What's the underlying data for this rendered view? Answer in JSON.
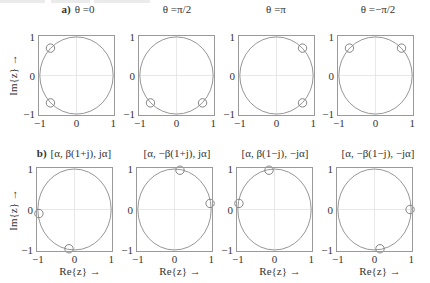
{
  "figure": {
    "row_a": {
      "prefix": "a)",
      "ylabel": "Im{z}  →"
    },
    "row_b": {
      "prefix": "b)",
      "ylabel": "Im{z}  →",
      "xlabel": "Re{z}  →"
    }
  },
  "chart_data": [
    {
      "type": "scatter",
      "row": "a",
      "title": "θ =0",
      "xlim": [
        -1,
        1
      ],
      "ylim": [
        -1,
        1
      ],
      "xticks": [
        "−1",
        "0",
        "1"
      ],
      "yticks": [
        "1",
        "0",
        "−1"
      ],
      "unit_circle": true,
      "points": [
        [
          -0.71,
          0.71
        ],
        [
          -0.71,
          -0.71
        ]
      ]
    },
    {
      "type": "scatter",
      "row": "a",
      "title": "θ =π/2",
      "xlim": [
        -1,
        1
      ],
      "ylim": [
        -1,
        1
      ],
      "xticks": [
        "−1",
        "0",
        "1"
      ],
      "yticks": [
        "1",
        "0",
        "−1"
      ],
      "unit_circle": true,
      "points": [
        [
          -0.71,
          -0.71
        ],
        [
          0.71,
          -0.71
        ]
      ]
    },
    {
      "type": "scatter",
      "row": "a",
      "title": "θ =π",
      "xlim": [
        -1,
        1
      ],
      "ylim": [
        -1,
        1
      ],
      "xticks": [
        "−1",
        "0",
        "1"
      ],
      "yticks": [
        "1",
        "0",
        "−1"
      ],
      "unit_circle": true,
      "points": [
        [
          0.71,
          0.71
        ],
        [
          0.71,
          -0.71
        ]
      ]
    },
    {
      "type": "scatter",
      "row": "a",
      "title": "θ =−π/2",
      "xlim": [
        -1,
        1
      ],
      "ylim": [
        -1,
        1
      ],
      "xticks": [
        "−1",
        "0",
        "1"
      ],
      "yticks": [
        "1",
        "0",
        "−1"
      ],
      "unit_circle": true,
      "points": [
        [
          -0.71,
          0.71
        ],
        [
          0.71,
          0.71
        ]
      ]
    },
    {
      "type": "scatter",
      "row": "b",
      "title": "[α, β(1+j), jα]",
      "xlim": [
        -1,
        1
      ],
      "ylim": [
        -1,
        1
      ],
      "xticks": [
        "−1",
        "0",
        "1"
      ],
      "yticks": [
        "1",
        "0",
        "−1"
      ],
      "unit_circle": true,
      "points": [
        [
          -0.97,
          -0.1
        ],
        [
          -0.15,
          -0.97
        ]
      ]
    },
    {
      "type": "scatter",
      "row": "b",
      "title": "[α, −β(1+j), jα]",
      "xlim": [
        -1,
        1
      ],
      "ylim": [
        -1,
        1
      ],
      "xticks": [
        "−1",
        "0",
        "1"
      ],
      "yticks": [
        "1",
        "0",
        "−1"
      ],
      "unit_circle": true,
      "points": [
        [
          0.15,
          0.97
        ],
        [
          0.97,
          0.15
        ]
      ]
    },
    {
      "type": "scatter",
      "row": "b",
      "title": "[α, β(1−j), −jα]",
      "xlim": [
        -1,
        1
      ],
      "ylim": [
        -1,
        1
      ],
      "xticks": [
        "−1",
        "0",
        "1"
      ],
      "yticks": [
        "1",
        "0",
        "−1"
      ],
      "unit_circle": true,
      "points": [
        [
          -0.15,
          0.97
        ],
        [
          -0.97,
          0.15
        ]
      ]
    },
    {
      "type": "scatter",
      "row": "b",
      "title": "[α, −β(1−j), −jα]",
      "xlim": [
        -1,
        1
      ],
      "ylim": [
        -1,
        1
      ],
      "xticks": [
        "−1",
        "0",
        "1"
      ],
      "yticks": [
        "1",
        "0",
        "−1"
      ],
      "unit_circle": true,
      "points": [
        [
          0.97,
          0.0
        ],
        [
          0.15,
          -0.97
        ]
      ]
    }
  ]
}
